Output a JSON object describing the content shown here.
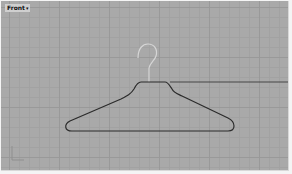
{
  "viewport": {
    "title": "Front",
    "menu_arrow": "▾",
    "background": "#a9a9a9",
    "grid_color": "#999999",
    "curve_color": "#2b2b2b",
    "hook_color": "#d6d6d6",
    "axis_gizmo": "world-axes-icon"
  }
}
